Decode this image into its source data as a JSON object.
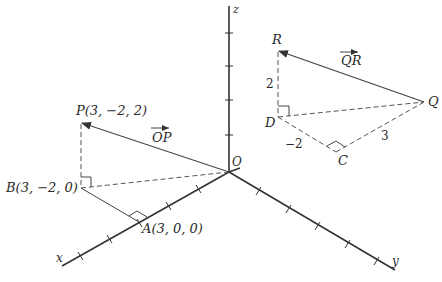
{
  "figure": {
    "axes": {
      "x_label": "x",
      "y_label": "y",
      "z_label": "z",
      "origin_label": "O"
    },
    "points": {
      "P": "P(3, −2, 2)",
      "B": "B(3, −2, 0)",
      "A": "A(3, 0, 0)",
      "R": "R",
      "Q": "Q",
      "D": "D",
      "C": "C"
    },
    "vectors": {
      "OP": "OP",
      "QR": "QR"
    },
    "segment_labels": {
      "RD": "2",
      "DC": "−2",
      "CQ": "3"
    }
  }
}
